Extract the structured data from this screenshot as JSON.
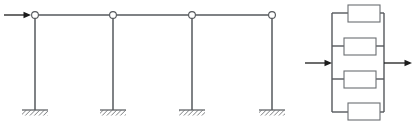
{
  "figure": {
    "title": "Multi-bay portal frame with lateral load and equivalent parallel element network",
    "canvas": {
      "width": 416,
      "height": 127,
      "background": "#ffffff"
    },
    "colors": {
      "line": "#55585c",
      "arrow": "#1c1c1c",
      "box_stroke": "#6b6e72",
      "fill": "#ffffff"
    }
  },
  "left_diagram": {
    "name": "portal-frame",
    "description": "Rigid beam on four pin-topped columns with fixed bases",
    "beam": {
      "y": 15,
      "x_start": 34,
      "x_end": 276
    },
    "joints": [
      {
        "label": "joint-1",
        "x": 35,
        "y": 15,
        "r": 3.4
      },
      {
        "label": "joint-2",
        "x": 113,
        "y": 15,
        "r": 3.4
      },
      {
        "label": "joint-3",
        "x": 192,
        "y": 15,
        "r": 3.4
      },
      {
        "label": "joint-4",
        "x": 272,
        "y": 15,
        "r": 3.4
      }
    ],
    "columns": [
      {
        "label": "column-1",
        "x": 35,
        "y_top": 18,
        "y_bottom": 110
      },
      {
        "label": "column-2",
        "x": 113,
        "y_top": 18,
        "y_bottom": 110
      },
      {
        "label": "column-3",
        "x": 192,
        "y_top": 18,
        "y_bottom": 110
      },
      {
        "label": "column-4",
        "x": 272,
        "y_top": 18,
        "y_bottom": 110
      }
    ],
    "supports": [
      {
        "label": "fixed-support-1",
        "x": 35,
        "y": 110,
        "half_width": 13
      },
      {
        "label": "fixed-support-2",
        "x": 113,
        "y": 110,
        "half_width": 13
      },
      {
        "label": "fixed-support-3",
        "x": 192,
        "y": 110,
        "half_width": 13
      },
      {
        "label": "fixed-support-4",
        "x": 272,
        "y": 110,
        "half_width": 13
      }
    ],
    "load_arrow": {
      "label": "lateral-load-arrow",
      "direction": "right",
      "x_tail": 4,
      "x_head": 31,
      "y": 15
    }
  },
  "right_diagram": {
    "name": "parallel-element-network",
    "description": "Four elements connected in parallel between two rigid nodes, loaded in tension",
    "rails": {
      "left_x": 332,
      "right_x": 384,
      "y_top": 13,
      "y_bottom": 112
    },
    "elements": [
      {
        "label": "element-1",
        "x": 348,
        "y": 5,
        "width": 32,
        "height": 17,
        "lead_y": 13
      },
      {
        "label": "element-2",
        "x": 344,
        "y": 38,
        "width": 32,
        "height": 17,
        "lead_y": 46
      },
      {
        "label": "element-3",
        "x": 344,
        "y": 71,
        "width": 32,
        "height": 17,
        "lead_y": 79
      },
      {
        "label": "element-4",
        "x": 348,
        "y": 103,
        "width": 32,
        "height": 17,
        "lead_y": 112
      }
    ],
    "load_arrows": [
      {
        "label": "left-load-arrow",
        "direction": "right",
        "x_tail": 305,
        "x_head": 332,
        "y": 63
      },
      {
        "label": "right-load-arrow",
        "direction": "right",
        "x_tail": 384,
        "x_head": 412,
        "y": 63
      }
    ]
  }
}
